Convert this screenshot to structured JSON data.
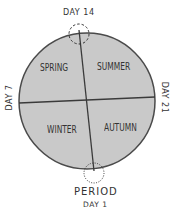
{
  "diagram": {
    "colors": {
      "fill": "#c9c9c9",
      "stroke": "#4a4a4a",
      "text": "#3a3a3a"
    },
    "quadrants": [
      {
        "id": "spring",
        "label": "SPRING"
      },
      {
        "id": "summer",
        "label": "SUMMER"
      },
      {
        "id": "winter",
        "label": "WINTER"
      },
      {
        "id": "autumn",
        "label": "AUTUMN"
      }
    ],
    "markers": {
      "top": "DAY 14",
      "left": "DAY 7",
      "right": "DAY 21",
      "bottom_title": "PERIOD",
      "bottom_sub": "DAY 1"
    }
  }
}
